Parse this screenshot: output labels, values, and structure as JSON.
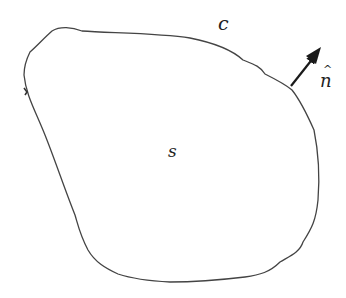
{
  "diagram": {
    "type": "closed-region-with-boundary-normal",
    "labels": {
      "boundary": "c",
      "surface": "s",
      "normal": "n",
      "normal_hat": "^"
    },
    "colors": {
      "stroke": "#444444",
      "arrow": "#1a1a1a",
      "text": "#222222",
      "background": "#ffffff"
    },
    "boundary_path": "M 52 31 C 60 26, 72 27, 82 31 C 110 33, 160 33, 190 38 C 210 42, 230 48, 243 60 C 253 64, 260 66, 265 74 C 275 79, 285 84, 292 90 C 300 100, 306 112, 314 130 C 318 150, 320 175, 318 200 C 316 220, 312 228, 303 242 C 300 252, 290 256, 280 262 C 270 272, 260 275, 245 277 C 220 280, 190 282, 170 282 C 150 281, 130 278, 118 274 C 105 268, 95 262, 88 250 C 80 235, 78 225, 75 215 C 65 190, 55 160, 45 135 C 35 110, 26 95, 24 75 C 24 68, 26 60, 30 52 C 38 45, 44 38, 52 31 Z",
    "normal_arrow": {
      "start": [
        291,
        86
      ],
      "end": [
        318,
        52
      ]
    }
  }
}
